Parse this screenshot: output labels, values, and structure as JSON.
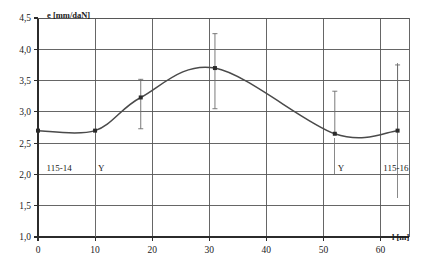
{
  "chart_data": {
    "type": "line",
    "title": "",
    "xlabel": "l [m]",
    "ylabel": "e [mm/daN]",
    "xlim": [
      0,
      65
    ],
    "ylim": [
      1.0,
      4.5
    ],
    "grid": true,
    "legend": "none",
    "x_ticks": [
      "0",
      "10",
      "20",
      "30",
      "40",
      "50",
      "60"
    ],
    "x_tick_values": [
      0,
      10,
      20,
      30,
      40,
      50,
      60
    ],
    "y_ticks": [
      "1,0",
      "1,5",
      "2,0",
      "2,5",
      "3,0",
      "3,5",
      "4,0",
      "4,5"
    ],
    "y_tick_values": [
      1.0,
      1.5,
      2.0,
      2.5,
      3.0,
      3.5,
      4.0,
      4.5
    ],
    "series": [
      {
        "name": "e",
        "x": [
          0,
          10,
          18,
          31,
          52,
          63
        ],
        "values": [
          2.7,
          2.7,
          3.23,
          3.7,
          2.65,
          2.7
        ],
        "errors_low": [
          null,
          null,
          2.73,
          3.05,
          null,
          null
        ],
        "errors_high": [
          null,
          null,
          3.52,
          4.25,
          3.33,
          3.75
        ]
      }
    ],
    "annotations": [
      {
        "text": "115-14",
        "x": 1.5,
        "y": 2.05
      },
      {
        "text": "Y",
        "x": 10.5,
        "y": 2.05
      },
      {
        "text": "Y",
        "x": 52.5,
        "y": 2.05
      },
      {
        "text": "115-16",
        "x": 60.5,
        "y": 2.05
      }
    ],
    "colors": {
      "curve": "#4a4a4a",
      "grid": "#555555",
      "axis": "#2b2b2b",
      "errorbar": "#6b6b6b",
      "marker": "#2b2b2b",
      "background": "#ffffff"
    }
  }
}
